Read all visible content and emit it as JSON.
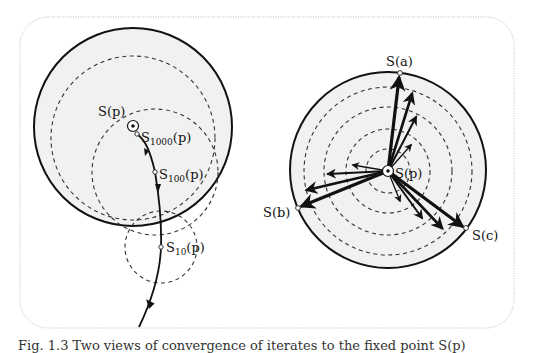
{
  "figure": {
    "left_panel": {
      "labels": {
        "fixed_point": "S(p)",
        "s1000_main": "S",
        "s1000_sub": "1000",
        "s1000_arg": "(p)",
        "s100_main": "S",
        "s100_sub": "100",
        "s100_arg": "(p)",
        "s10_main": "S",
        "s10_sub": "10",
        "s10_arg": "(p)"
      }
    },
    "right_panel": {
      "labels": {
        "center": "S(p)",
        "point_a": "S(a)",
        "point_b": "S(b)",
        "point_c": "S(c)"
      }
    },
    "caption": "Fig. 1.3  Two views of convergence of iterates to the fixed point S(p)"
  },
  "colors": {
    "disk_fill": "#f1f1f1",
    "stroke": "#111111",
    "frame": "#b8b8b8"
  }
}
